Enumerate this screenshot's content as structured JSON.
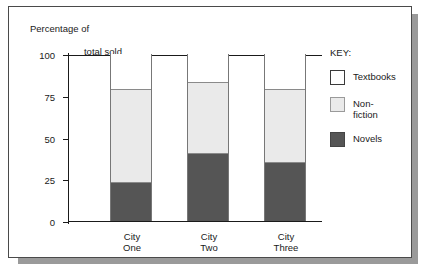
{
  "chart_data": {
    "type": "bar",
    "subtype": "stacked-bar",
    "title": "Percentage of total sold",
    "title_line1": "Percentage of",
    "title_line2": "total sold",
    "xlabel": "",
    "ylabel": "Percentage of total sold",
    "categories": [
      "City One",
      "City Two",
      "City Three"
    ],
    "category_lines": [
      [
        "City",
        "One"
      ],
      [
        "City",
        "Two"
      ],
      [
        "City",
        "Three"
      ]
    ],
    "series": [
      {
        "name": "Novels",
        "values": [
          23,
          40,
          35
        ],
        "color": "#555555"
      },
      {
        "name": "Non-fiction",
        "values": [
          56,
          43,
          44
        ],
        "color": "#eaeaea"
      },
      {
        "name": "Textbooks",
        "values": [
          21,
          17,
          21
        ],
        "color": "#ffffff"
      }
    ],
    "cumulative_tops": {
      "novels": [
        23,
        40,
        35
      ],
      "nonfiction": [
        79,
        83,
        79
      ],
      "textbooks": [
        100,
        100,
        100
      ]
    },
    "ylim": [
      0,
      100
    ],
    "yticks": [
      100,
      75,
      50,
      25,
      0
    ],
    "ytick_labels": [
      "100",
      "75",
      "50",
      "25",
      "0"
    ],
    "grid": false,
    "legend_position": "right"
  },
  "legend": {
    "title": "KEY:",
    "entries": [
      {
        "label": "Textbooks",
        "label_display": "Textbooks",
        "swatch": "white-swatch"
      },
      {
        "label": "Non-fiction",
        "label_display": "Non-\nfiction",
        "swatch": "light-gray-swatch"
      },
      {
        "label": "Novels",
        "label_display": "Novels",
        "swatch": "dark-gray-swatch"
      }
    ]
  },
  "colors": {
    "novels": "#555555",
    "nonfiction": "#eaeaea",
    "textbooks": "#ffffff",
    "axis": "#1a1a1a",
    "frame": "#4a4a4a",
    "shadow": "#9a9a9a"
  }
}
